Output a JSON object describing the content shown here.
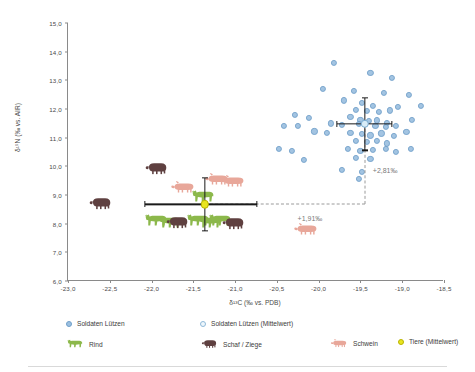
{
  "chart_data": {
    "type": "scatter",
    "title": "",
    "xlabel": "δ¹³C (‰ vs. PDB)",
    "ylabel": "δ¹⁵N (‰ vs. AIR)",
    "xlim": [
      -23.0,
      -18.5
    ],
    "ylim": [
      6.0,
      15.0
    ],
    "xticks": [
      "-23,0",
      "-22,5",
      "-22,0",
      "-21,5",
      "-21,0",
      "-20,5",
      "-20,0",
      "-19,5",
      "-19,0",
      "-18,5"
    ],
    "xtick_values": [
      -23.0,
      -22.5,
      -22.0,
      -21.5,
      -21.0,
      -20.5,
      -20.0,
      -19.5,
      -19.0,
      -18.5
    ],
    "yticks": [
      "6,0",
      "7,0",
      "8,0",
      "9,0",
      "10,0",
      "11,0",
      "12,0",
      "13,0",
      "14,0",
      "15,0"
    ],
    "ytick_values": [
      6.0,
      7.0,
      8.0,
      9.0,
      10.0,
      11.0,
      12.0,
      13.0,
      14.0,
      15.0
    ],
    "grid": false,
    "legend_position": "bottom",
    "series": [
      {
        "name": "Soldaten Lützen",
        "marker": "filled-circle",
        "color": "#9cc0e0",
        "points": [
          [
            -19.82,
            13.62
          ],
          [
            -19.38,
            13.25
          ],
          [
            -19.12,
            13.08
          ],
          [
            -19.95,
            12.7
          ],
          [
            -19.58,
            12.62
          ],
          [
            -19.22,
            12.55
          ],
          [
            -18.92,
            12.48
          ],
          [
            -19.7,
            12.3
          ],
          [
            -19.48,
            12.22
          ],
          [
            -19.35,
            12.12
          ],
          [
            -19.05,
            12.08
          ],
          [
            -18.78,
            12.1
          ],
          [
            -19.55,
            11.98
          ],
          [
            -19.42,
            11.93
          ],
          [
            -19.28,
            11.9
          ],
          [
            -19.15,
            11.95
          ],
          [
            -20.28,
            11.78
          ],
          [
            -20.12,
            11.68
          ],
          [
            -19.62,
            11.72
          ],
          [
            -19.5,
            11.62
          ],
          [
            -19.4,
            11.58
          ],
          [
            -19.3,
            11.6
          ],
          [
            -19.18,
            11.52
          ],
          [
            -18.88,
            11.62
          ],
          [
            -20.42,
            11.42
          ],
          [
            -20.25,
            11.4
          ],
          [
            -19.85,
            11.5
          ],
          [
            -19.72,
            11.45
          ],
          [
            -19.52,
            11.48
          ],
          [
            -19.45,
            11.5
          ],
          [
            -19.32,
            11.42
          ],
          [
            -19.2,
            11.38
          ],
          [
            -19.08,
            11.4
          ],
          [
            -20.05,
            11.22
          ],
          [
            -19.9,
            11.18
          ],
          [
            -19.62,
            11.18
          ],
          [
            -19.48,
            11.12
          ],
          [
            -19.38,
            11.08
          ],
          [
            -19.25,
            11.15
          ],
          [
            -19.1,
            11.05
          ],
          [
            -18.95,
            11.2
          ],
          [
            -19.55,
            10.9
          ],
          [
            -19.42,
            10.85
          ],
          [
            -19.3,
            10.88
          ],
          [
            -19.18,
            10.8
          ],
          [
            -20.48,
            10.62
          ],
          [
            -20.32,
            10.55
          ],
          [
            -19.65,
            10.62
          ],
          [
            -19.5,
            10.55
          ],
          [
            -19.35,
            10.58
          ],
          [
            -19.2,
            10.6
          ],
          [
            -19.08,
            10.5
          ],
          [
            -18.9,
            10.62
          ],
          [
            -20.18,
            10.22
          ],
          [
            -19.55,
            10.28
          ],
          [
            -19.38,
            10.25
          ],
          [
            -19.72,
            9.88
          ],
          [
            -19.48,
            9.8
          ],
          [
            -19.52,
            9.55
          ]
        ]
      },
      {
        "name": "Soldaten Lützen (Mittelwert)",
        "marker": "open-circle",
        "color": "#d8ecf7",
        "mean": [
          -19.45,
          11.48
        ],
        "xerr": [
          0.33,
          0.33
        ],
        "yerr": [
          0.92,
          0.92
        ]
      },
      {
        "name": "Tiere (Mittelwert)",
        "marker": "filled-circle",
        "color": "#e9e520",
        "mean": [
          -21.36,
          8.67
        ],
        "xerr": [
          0.72,
          0.62
        ],
        "yerr": [
          0.92,
          0.92
        ]
      }
    ],
    "animal_groups": [
      {
        "name": "Rind",
        "color": "#8cb84b",
        "points": [
          [
            -21.95,
            8.12
          ],
          [
            -21.78,
            8.05
          ],
          [
            -21.45,
            8.12
          ],
          [
            -21.3,
            8.05
          ],
          [
            -21.18,
            8.12
          ],
          [
            -21.38,
            8.95
          ]
        ]
      },
      {
        "name": "Schaf / Ziege",
        "color": "#5f4040",
        "points": [
          [
            -22.62,
            8.72
          ],
          [
            -21.7,
            8.05
          ],
          [
            -21.02,
            8.02
          ],
          [
            -21.95,
            9.95
          ]
        ]
      },
      {
        "name": "Schwein",
        "color": "#e8a79a",
        "points": [
          [
            -21.62,
            9.28
          ],
          [
            -21.22,
            9.55
          ],
          [
            -21.02,
            9.48
          ],
          [
            -20.15,
            7.82
          ]
        ]
      }
    ],
    "annotations": [
      {
        "text": "+2,81‰",
        "x": -19.4,
        "y": 9.85,
        "kind": "vertical-offset"
      },
      {
        "text": "+1,91‰",
        "x": -20.3,
        "y": 8.18,
        "kind": "horizontal-offset"
      }
    ]
  },
  "legend": {
    "row1": [
      {
        "label": "Soldaten Lützen",
        "marker": "dot-blue"
      },
      {
        "label": "Soldaten Lützen (Mittelwert)",
        "marker": "dot-blue-open"
      }
    ],
    "row2": [
      {
        "label": "Rind",
        "marker": "cow-icon"
      },
      {
        "label": "Schaf / Ziege",
        "marker": "sheep-icon"
      },
      {
        "label": "Schwein",
        "marker": "pig-icon"
      },
      {
        "label": "Tiere (Mittelwert)",
        "marker": "dot-yellow"
      }
    ]
  },
  "colors": {
    "scatter": "#9cc0e0",
    "scatter_border": "#6f9fca",
    "mean_soldier": "#d8ecf7",
    "mean_animal": "#e9e520",
    "cow": "#8cb84b",
    "sheep": "#5f4040",
    "pig": "#e8a79a",
    "axis": "#8a8a8a",
    "annotation": "#7a7a7a"
  }
}
